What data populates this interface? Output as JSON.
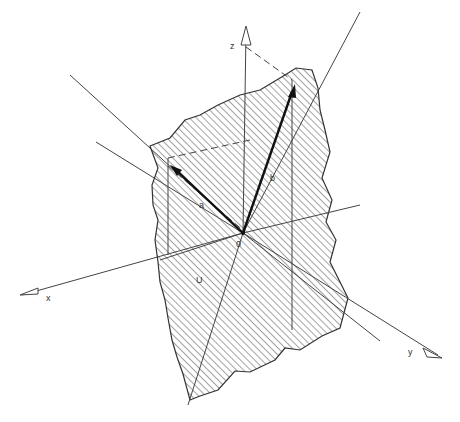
{
  "figure": {
    "labels": {
      "z": "z",
      "x": "x",
      "y": "y",
      "origin": "0",
      "a": "a",
      "b": "b",
      "plane": "U"
    },
    "colors": {
      "line": "#333333",
      "hatch": "#555555",
      "background": "#ffffff"
    }
  }
}
